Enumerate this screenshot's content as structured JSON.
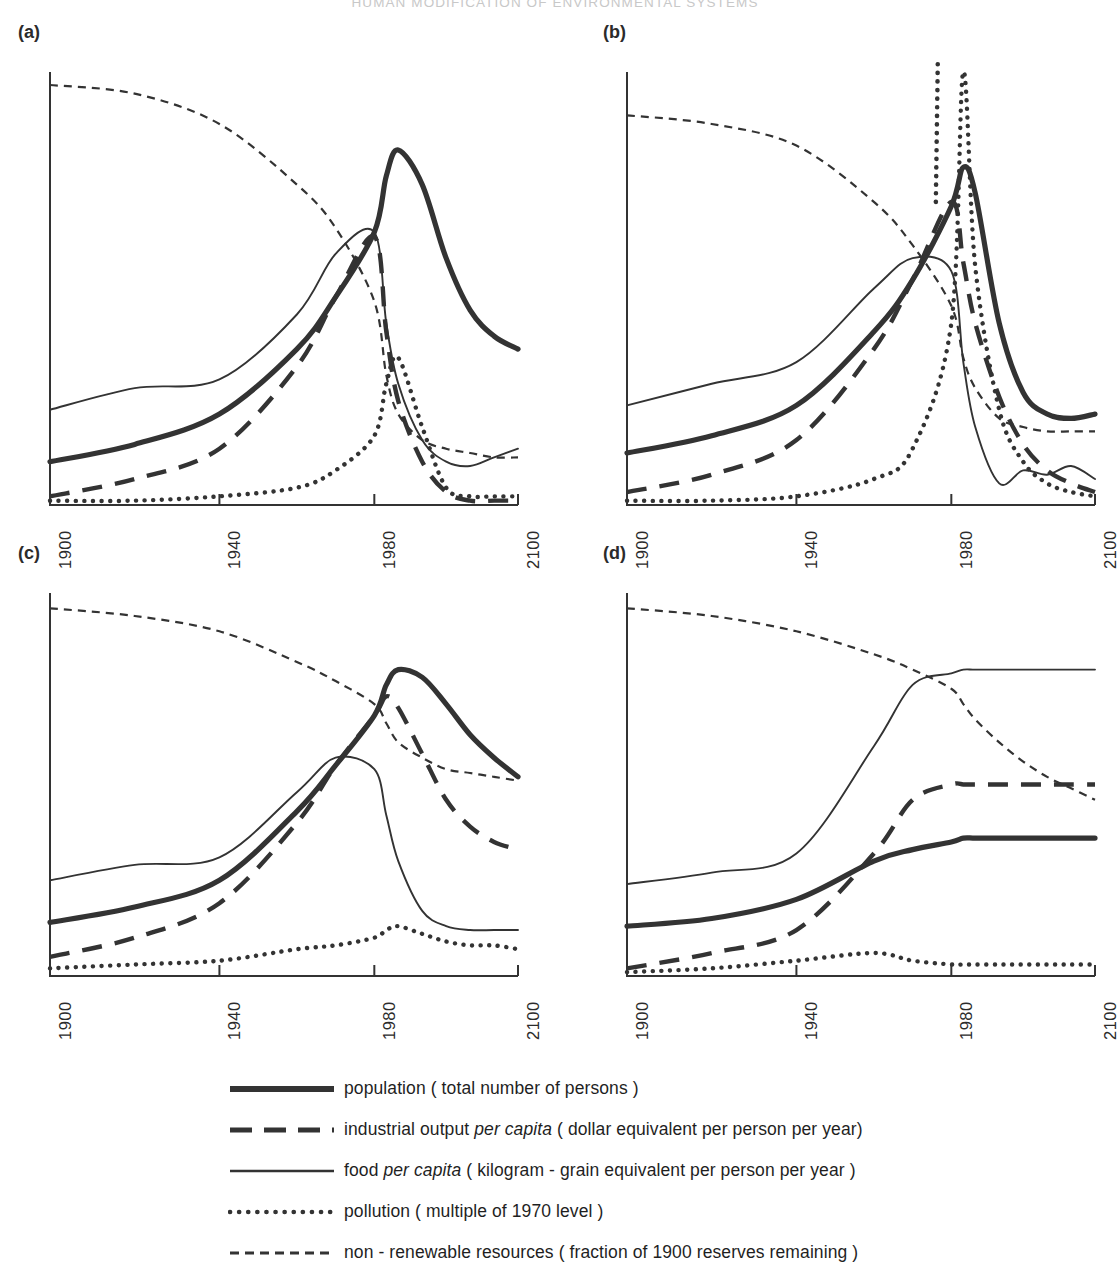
{
  "running_head": "HUMAN MODIFICATION OF ENVIRONMENTAL SYSTEMS",
  "panels": [
    {
      "label": "(a)",
      "name": "standard-run"
    },
    {
      "label": "(b)",
      "name": "pollution-crisis"
    },
    {
      "label": "(c)",
      "name": "resource-constrained"
    },
    {
      "label": "(d)",
      "name": "stabilized-equilibrium"
    }
  ],
  "axis": {
    "ticks": [
      "1900",
      "1940",
      "1980",
      "2100"
    ],
    "tick_fractions": [
      0.0,
      0.362,
      0.693,
      1.0
    ],
    "xmin": 1900,
    "xmax": 2100
  },
  "legend": {
    "position": "below-panels",
    "entries": [
      {
        "style": "thick-solid",
        "label": "population ( total number of persons )"
      },
      {
        "style": "long-dash",
        "label": "industrial output per capita ( dollar equivalent per person per year)",
        "italic": "per capita"
      },
      {
        "style": "thin-solid",
        "label": "food per capita ( kilogram - grain equivalent per person per year )",
        "italic": "per capita"
      },
      {
        "style": "dotted",
        "label": "pollution ( multiple of 1970 level )"
      },
      {
        "style": "short-dash",
        "label": "non - renewable resources ( fraction of 1900 reserves remaining )"
      }
    ]
  },
  "chart_data": {
    "type": "line",
    "xlabel": "",
    "ylabel": "",
    "grid": false,
    "xlim": [
      1900,
      2100
    ],
    "ylim": [
      0,
      1
    ],
    "note": "y axis unscaled / unlabelled; values are normalised 0-1 fractions of panel height read off the figure",
    "series_styles": {
      "population": "thick-solid",
      "industrial_output_per_capita": "long-dash",
      "food_per_capita": "thin-solid",
      "pollution": "dotted",
      "non_renewable_resources": "short-dash"
    },
    "x": [
      1900,
      1920,
      1940,
      1960,
      1970,
      1980,
      1990,
      2000,
      2020,
      2040,
      2060,
      2080,
      2100
    ],
    "panels": [
      {
        "label": "(a)",
        "name": "standard-run",
        "series": [
          {
            "name": "population",
            "values": [
              0.1,
              0.14,
              0.21,
              0.36,
              0.48,
              0.63,
              0.76,
              0.82,
              0.74,
              0.57,
              0.45,
              0.39,
              0.36
            ]
          },
          {
            "name": "industrial output per capita",
            "values": [
              0.02,
              0.06,
              0.13,
              0.32,
              0.48,
              0.62,
              0.4,
              0.24,
              0.1,
              0.03,
              0.01,
              0.01,
              0.01
            ]
          },
          {
            "name": "food per capita",
            "values": [
              0.22,
              0.27,
              0.29,
              0.44,
              0.58,
              0.63,
              0.42,
              0.28,
              0.15,
              0.1,
              0.09,
              0.11,
              0.13
            ]
          },
          {
            "name": "pollution",
            "values": [
              0.01,
              0.01,
              0.02,
              0.04,
              0.08,
              0.16,
              0.28,
              0.34,
              0.18,
              0.04,
              0.02,
              0.02,
              0.02
            ]
          },
          {
            "name": "non-renewable resources",
            "values": [
              0.97,
              0.95,
              0.88,
              0.74,
              0.64,
              0.47,
              0.3,
              0.21,
              0.15,
              0.13,
              0.12,
              0.11,
              0.11
            ]
          }
        ]
      },
      {
        "label": "(b)",
        "name": "pollution-crisis",
        "series": [
          {
            "name": "population",
            "values": [
              0.12,
              0.16,
              0.23,
              0.4,
              0.52,
              0.69,
              0.78,
              0.72,
              0.42,
              0.26,
              0.21,
              0.2,
              0.21
            ]
          },
          {
            "name": "industrial output per capita",
            "values": [
              0.03,
              0.07,
              0.15,
              0.36,
              0.52,
              0.7,
              0.56,
              0.42,
              0.25,
              0.14,
              0.08,
              0.05,
              0.03
            ]
          },
          {
            "name": "food per capita",
            "values": [
              0.23,
              0.28,
              0.33,
              0.5,
              0.57,
              0.54,
              0.33,
              0.18,
              0.05,
              0.08,
              0.07,
              0.09,
              0.06
            ]
          },
          {
            "name": "pollution",
            "values": [
              0.01,
              0.01,
              0.02,
              0.06,
              0.13,
              0.42,
              1.0,
              0.55,
              0.22,
              0.1,
              0.05,
              0.03,
              0.02
            ]
          },
          {
            "name": "non-renewable resources",
            "values": [
              0.9,
              0.88,
              0.83,
              0.7,
              0.6,
              0.46,
              0.34,
              0.27,
              0.2,
              0.18,
              0.17,
              0.17,
              0.17
            ]
          }
        ]
      },
      {
        "label": "(c)",
        "name": "resource-constrained",
        "series": [
          {
            "name": "population",
            "values": [
              0.14,
              0.18,
              0.25,
              0.43,
              0.55,
              0.68,
              0.76,
              0.8,
              0.78,
              0.71,
              0.63,
              0.57,
              0.52
            ]
          },
          {
            "name": "industrial output per capita",
            "values": [
              0.05,
              0.1,
              0.19,
              0.4,
              0.55,
              0.68,
              0.73,
              0.7,
              0.58,
              0.46,
              0.39,
              0.35,
              0.33
            ]
          },
          {
            "name": "food per capita",
            "values": [
              0.25,
              0.29,
              0.31,
              0.48,
              0.57,
              0.54,
              0.42,
              0.3,
              0.17,
              0.13,
              0.12,
              0.12,
              0.12
            ]
          },
          {
            "name": "pollution",
            "values": [
              0.02,
              0.03,
              0.04,
              0.07,
              0.08,
              0.1,
              0.12,
              0.13,
              0.11,
              0.09,
              0.08,
              0.08,
              0.07
            ]
          },
          {
            "name": "non-renewable resources",
            "values": [
              0.96,
              0.94,
              0.9,
              0.82,
              0.77,
              0.71,
              0.66,
              0.61,
              0.57,
              0.54,
              0.53,
              0.52,
              0.51
            ]
          }
        ]
      },
      {
        "label": "(d)",
        "name": "stabilized-equilibrium",
        "series": [
          {
            "name": "population",
            "values": [
              0.13,
              0.15,
              0.2,
              0.3,
              0.33,
              0.35,
              0.36,
              0.36,
              0.36,
              0.36,
              0.36,
              0.36,
              0.36
            ]
          },
          {
            "name": "industrial output per capita",
            "values": [
              0.02,
              0.06,
              0.12,
              0.32,
              0.46,
              0.5,
              0.5,
              0.5,
              0.5,
              0.5,
              0.5,
              0.5,
              0.5
            ]
          },
          {
            "name": "food per capita",
            "values": [
              0.24,
              0.27,
              0.32,
              0.6,
              0.76,
              0.79,
              0.8,
              0.8,
              0.8,
              0.8,
              0.8,
              0.8,
              0.8
            ]
          },
          {
            "name": "pollution",
            "values": [
              0.01,
              0.02,
              0.04,
              0.06,
              0.04,
              0.03,
              0.03,
              0.03,
              0.03,
              0.03,
              0.03,
              0.03,
              0.03
            ]
          },
          {
            "name": "non-renewable resources",
            "values": [
              0.96,
              0.94,
              0.9,
              0.84,
              0.8,
              0.75,
              0.71,
              0.67,
              0.61,
              0.56,
              0.52,
              0.49,
              0.46
            ]
          }
        ]
      }
    ]
  }
}
